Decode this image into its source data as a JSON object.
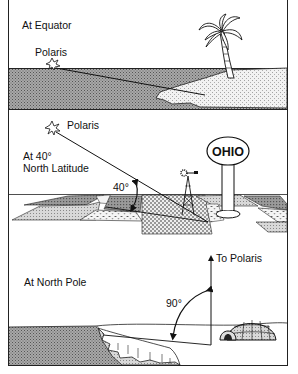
{
  "figure": {
    "panels": [
      {
        "id": "equator",
        "heading": "At Equator",
        "star_label": "Polaris",
        "angle_label": ""
      },
      {
        "id": "latitude-40",
        "heading_line1": "At 40°",
        "heading_line2": "North Latitude",
        "star_label": "Polaris",
        "angle_label": "40°",
        "sign_text": "OHIO"
      },
      {
        "id": "north-pole",
        "heading": "At North Pole",
        "star_label": "To Polaris",
        "angle_label": "90°"
      }
    ]
  },
  "colors": {
    "line": "#111111",
    "water": "#8a8a8a",
    "sand": "#d6d6d6",
    "background": "#ffffff"
  }
}
